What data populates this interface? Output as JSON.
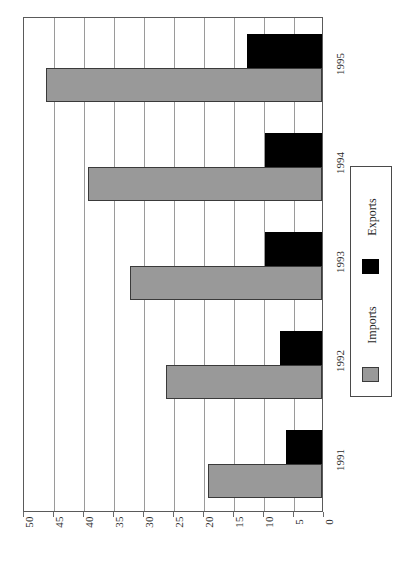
{
  "chart_data": {
    "type": "bar",
    "orientation": "horizontal",
    "title": "",
    "xlabel": "",
    "ylabel": "",
    "categories": [
      "1991",
      "1992",
      "1993",
      "1994",
      "1995"
    ],
    "series": [
      {
        "name": "Imports",
        "color": "#999999",
        "values": [
          19,
          26,
          32,
          39,
          46
        ]
      },
      {
        "name": "Exports",
        "color": "#000000",
        "values": [
          6,
          7,
          9.5,
          9.5,
          12.5
        ]
      }
    ],
    "value_axis": {
      "min": 0,
      "max": 50,
      "tick_step": 5,
      "ticks": [
        50,
        45,
        40,
        35,
        30,
        25,
        20,
        15,
        10,
        5,
        0
      ],
      "direction": "right-to-left"
    },
    "grid": true,
    "legend": {
      "position": "right",
      "entries": [
        {
          "label": "Exports",
          "color": "#000000"
        },
        {
          "label": "Imports",
          "color": "#999999"
        }
      ]
    }
  }
}
